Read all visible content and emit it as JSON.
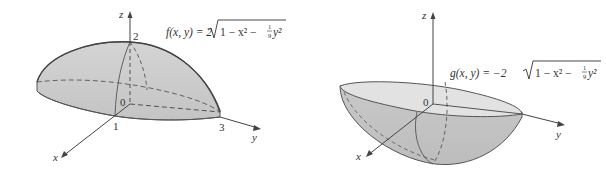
{
  "figures": [
    {
      "id": "upper-half-ellipsoid",
      "formula": {
        "lhs": "f(x, y) = 2",
        "radicand": "1 − x² − ",
        "frac_num": "1",
        "frac_den": "9",
        "tail": "y²"
      },
      "axis_labels": {
        "x": "x",
        "y": "y",
        "z": "z"
      },
      "tick_labels": {
        "origin": "0",
        "x": "1",
        "y": "3",
        "z": "2"
      }
    },
    {
      "id": "lower-half-ellipsoid",
      "formula": {
        "lhs": "g(x, y) = −2",
        "radicand": "1 − x² − ",
        "frac_num": "1",
        "frac_den": "9",
        "tail": "y²"
      },
      "axis_labels": {
        "x": "x",
        "y": "y",
        "z": "z"
      },
      "tick_labels": {
        "origin": "0"
      }
    }
  ],
  "colors": {
    "surface_fill": "#cfcfcf",
    "surface_light": "#e4e4e4",
    "outline": "#555555",
    "axis": "#444444"
  }
}
